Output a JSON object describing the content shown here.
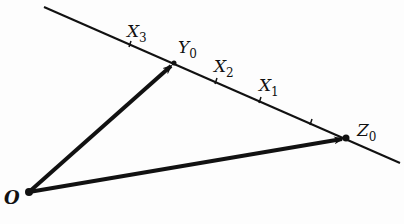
{
  "diagram": {
    "colors": {
      "ink": "#111111",
      "background": "#fdfdfd"
    },
    "line": {
      "from": [
        44,
        7
      ],
      "to": [
        400,
        163
      ]
    },
    "points": {
      "origin": {
        "label": "O",
        "sub": "",
        "x": 29,
        "y": 192
      },
      "Y0": {
        "label": "Y",
        "sub": "0",
        "x": 174,
        "y": 63
      },
      "Z0": {
        "label": "Z",
        "sub": "0",
        "x": 346,
        "y": 138
      }
    },
    "ticks": [
      {
        "label": "X",
        "sub": "3",
        "x": 130,
        "y": 44
      },
      {
        "label": "X",
        "sub": "2",
        "x": 216,
        "y": 81
      },
      {
        "label": "X",
        "sub": "1",
        "x": 260,
        "y": 100
      },
      {
        "label": "",
        "sub": "",
        "x": 311,
        "y": 122
      }
    ],
    "vectors": [
      {
        "from": "O",
        "to": "Y0"
      },
      {
        "from": "O",
        "to": "Z0"
      }
    ]
  }
}
